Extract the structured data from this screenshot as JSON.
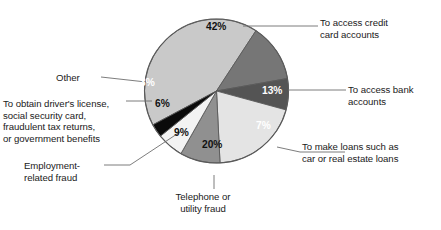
{
  "chart_data": {
    "type": "pie",
    "title": "",
    "subtitle": "",
    "xlabel": "",
    "ylabel": "",
    "grid": false,
    "legend_position": "callout-labels",
    "units": "percent",
    "total": 100,
    "categories": [
      "To access credit card accounts",
      "To access bank accounts",
      "To make loans such as car or real estate loans",
      "Telephone or utility fraud",
      "Employment-related fraud",
      "To obtain driver's license, social security card, fraudulent tax returns, or government benefits",
      "Other"
    ],
    "values": [
      42,
      13,
      7,
      20,
      9,
      6,
      3
    ],
    "data_labels": [
      "42%",
      "13%",
      "7%",
      "20%",
      "9%",
      "6%",
      "3%"
    ],
    "colors": [
      "#c9c9c9",
      "#767676",
      "#545454",
      "#e4e4e4",
      "#909090",
      "#f3f3f3",
      "#0a0a0a"
    ],
    "slices": [
      {
        "id": "credit-card",
        "label": "To access credit card accounts",
        "value": 42,
        "data_label": "42%",
        "color": "#c9c9c9",
        "label_color": "#111111",
        "start_deg": -118.0,
        "end_deg": 33.2
      },
      {
        "id": "bank-accounts",
        "label": "To access bank accounts",
        "value": 13,
        "data_label": "13%",
        "color": "#767676",
        "label_color": "#ffffff",
        "start_deg": 33.2,
        "end_deg": 80.0
      },
      {
        "id": "loans",
        "label": "To make loans such as car or real estate loans",
        "value": 7,
        "data_label": "7%",
        "color": "#545454",
        "label_color": "#ffffff",
        "start_deg": 80.0,
        "end_deg": 105.2
      },
      {
        "id": "telephone-utility",
        "label": "Telephone or utility fraud",
        "value": 20,
        "data_label": "20%",
        "color": "#e4e4e4",
        "label_color": "#111111",
        "start_deg": 105.2,
        "end_deg": 177.2
      },
      {
        "id": "employment",
        "label": "Employment-related fraud",
        "value": 9,
        "data_label": "9%",
        "color": "#909090",
        "label_color": "#111111",
        "start_deg": 177.2,
        "end_deg": 209.6
      },
      {
        "id": "drivers-license",
        "label": "To obtain driver's license, social security card, fraudulent tax returns, or government benefits",
        "value": 6,
        "data_label": "6%",
        "color": "#f3f3f3",
        "label_color": "#111111",
        "start_deg": 209.6,
        "end_deg": 231.2
      },
      {
        "id": "other",
        "label": "Other",
        "value": 3,
        "data_label": "3%",
        "color": "#0a0a0a",
        "label_color": "#ffffff",
        "start_deg": 231.2,
        "end_deg": 242.0
      }
    ]
  },
  "callouts": {
    "credit_card": "To access credit\ncard accounts",
    "bank_accounts": "To access bank\naccounts",
    "loans": "To make loans such as\ncar or real estate loans",
    "other": "Other",
    "drivers_license": "To obtain driver's license,\nsocial security card,\nfraudulent tax returns,\nor government benefits",
    "employment": "Employment-\nrelated fraud",
    "telephone": "Telephone or\nutility fraud"
  },
  "slice_labels": {
    "credit_card": "42%",
    "bank_accounts": "13%",
    "loans": "7%",
    "telephone": "20%",
    "employment": "9%",
    "drivers_license": "6%",
    "other": "3%"
  },
  "style": {
    "background": "#ffffff",
    "outline": "#5a5a5a",
    "leader_line": "#6e6e6e",
    "text": "#1a1a1a"
  }
}
